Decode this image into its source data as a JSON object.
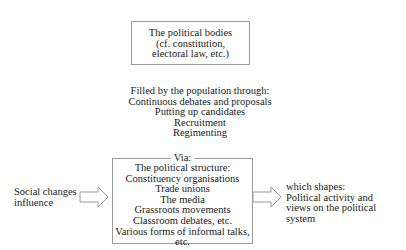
{
  "diagram": {
    "top_box": {
      "lines": [
        "The political bodies",
        "(cf. constitution,",
        "electoral law, etc.)"
      ]
    },
    "filled_by": {
      "lines": [
        "Filled by the population through:",
        "Continuous debates and proposals",
        "Putting up candidates",
        "Recruitment",
        "Regimenting"
      ]
    },
    "via_box": {
      "label": "Via:",
      "lines": [
        "The political structure:",
        "Constituency organisations",
        "Trade unions",
        "The media",
        "Grassroots movements",
        "Classroom debates, etc.",
        "Various forms of informal talks, etc."
      ]
    },
    "left_input": {
      "lines": [
        "Social changes",
        "influence"
      ],
      "arrow_icon": "hollow-right-arrow"
    },
    "right_output": {
      "lines": [
        "which shapes:",
        "Political activity and",
        "views on the political system"
      ],
      "arrow_icon": "hollow-right-arrow"
    },
    "colors": {
      "border": "#9a9a9a",
      "text": "#1a1a1a",
      "background": "#ffffff"
    }
  }
}
